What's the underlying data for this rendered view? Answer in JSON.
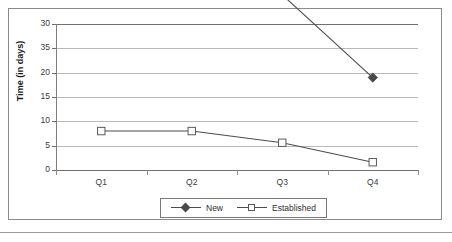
{
  "chart_data": {
    "type": "line",
    "title": "",
    "xlabel": "",
    "ylabel": "Time (in days)",
    "categories": [
      "Q1",
      "Q2",
      "Q3",
      "Q4"
    ],
    "y_tick_labels": [
      "30",
      "35",
      "20",
      "15",
      "10",
      "5",
      "0"
    ],
    "ylim": [
      0,
      30
    ],
    "grid": true,
    "legend_position": "bottom",
    "series": [
      {
        "name": "New",
        "marker": "filled-diamond",
        "color": "#4a4a4a",
        "values": [
          38,
          37,
          36,
          19
        ]
      },
      {
        "name": "Established",
        "marker": "open-square",
        "color": "#ffffff",
        "border_color": "#5a5a5a",
        "values": [
          8,
          8,
          5.6,
          1.6
        ]
      }
    ]
  },
  "legend": {
    "entries": [
      {
        "label": "New"
      },
      {
        "label": "Established"
      }
    ]
  },
  "colors": {
    "line": "#4d4d4d",
    "grid": "#b9b9b9",
    "axis": "#6f6f6f",
    "frame": "#8a8a8a",
    "text": "#3a3a3a"
  }
}
